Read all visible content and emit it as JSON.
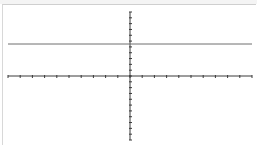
{
  "chart_data": {
    "type": "line",
    "title": "",
    "xlabel": "",
    "ylabel": "",
    "xlim": [
      -10,
      10
    ],
    "ylim": [
      -11,
      11
    ],
    "grid": false,
    "legend": null,
    "axes": {
      "x_ticks": [
        -10,
        -9,
        -8,
        -7,
        -6,
        -5,
        -4,
        -3,
        -2,
        -1,
        0,
        1,
        2,
        3,
        4,
        5,
        6,
        7,
        8,
        9,
        10
      ],
      "y_ticks": [
        -11,
        -10,
        -9,
        -8,
        -7,
        -6,
        -5,
        -4,
        -3,
        -2,
        -1,
        0,
        1,
        2,
        3,
        4,
        5,
        6,
        7,
        8,
        9,
        10,
        11
      ],
      "tick_labels_shown": false
    },
    "series": [
      {
        "name": "horizontal line",
        "equation": "y = 5.5",
        "x": [
          -10,
          10
        ],
        "y": [
          5.5,
          5.5
        ],
        "color": "#6e6e6e"
      }
    ]
  },
  "colors": {
    "axis": "#3a3a3a",
    "line": "#6e6e6e",
    "background": "#ffffff"
  }
}
